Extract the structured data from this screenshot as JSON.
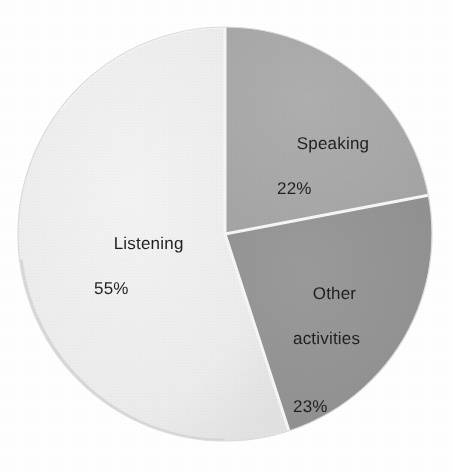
{
  "chart_data": {
    "type": "pie",
    "title": "",
    "subtitle": "",
    "xlabel": "",
    "ylabel": "",
    "legend_position": "none",
    "grid": false,
    "labels_inside_slices": true,
    "start_angle_deg": 0,
    "direction": "clockwise",
    "units": "percent",
    "total": 100,
    "categories": [
      "Speaking",
      "Other activities",
      "Listening"
    ],
    "values": [
      22,
      23,
      55
    ],
    "slices": [
      {
        "name": "Speaking",
        "label": "Speaking",
        "value": 22,
        "value_label": "22%",
        "color": "#a9a9a9",
        "start_deg": 0,
        "end_deg": 79.2
      },
      {
        "name": "Other activities",
        "label": "Other\nactivities",
        "label_line1": "Other",
        "label_line2": "activities",
        "value": 23,
        "value_label": "23%",
        "color": "#949494",
        "start_deg": 79.2,
        "end_deg": 162.0
      },
      {
        "name": "Listening",
        "label": "Listening",
        "value": 55,
        "value_label": "55%",
        "color": "#ededed",
        "start_deg": 162.0,
        "end_deg": 360.0
      }
    ],
    "colors": {
      "background": "#ffffff",
      "slice_speaking": "#a9a9a9",
      "slice_other_activities": "#949494",
      "slice_listening": "#ededed",
      "separator": "#f7f7f7",
      "label_text": "#1f1f1f",
      "rim_shadow": "#d0d0d0"
    },
    "geometry": {
      "center_x": 225,
      "center_y": 234,
      "radius": 207
    }
  }
}
